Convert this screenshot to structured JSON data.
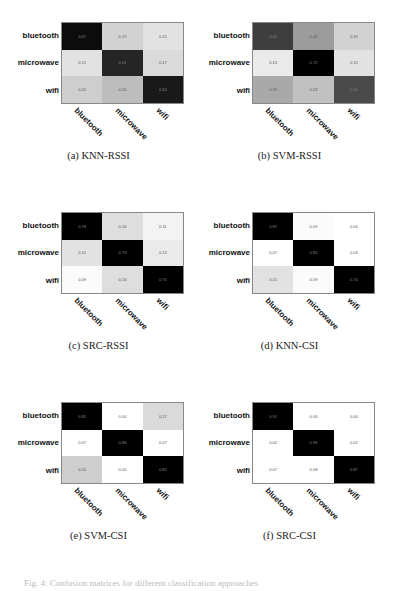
{
  "figure": {
    "caption_partial": "Fig. 4: Confusion matrices for different classification approaches"
  },
  "class_labels": [
    "bluetooth",
    "microwave",
    "wifi"
  ],
  "chart_data": [
    {
      "type": "heatmap",
      "title": "(a) KNN-RSSI",
      "rows": [
        "bluetooth",
        "microwave",
        "wifi"
      ],
      "cols": [
        "bluetooth",
        "microwave",
        "wifi"
      ],
      "values": [
        [
          0.67,
          0.19,
          0.15
        ],
        [
          0.15,
          0.61,
          0.17
        ],
        [
          0.2,
          0.24,
          0.64
        ]
      ]
    },
    {
      "type": "heatmap",
      "title": "(b) SVM-RSSI",
      "rows": [
        "bluetooth",
        "microwave",
        "wifi"
      ],
      "cols": [
        "bluetooth",
        "microwave",
        "wifi"
      ],
      "values": [
        [
          0.55,
          0.32,
          0.19
        ],
        [
          0.13,
          0.72,
          0.15
        ],
        [
          0.29,
          0.23,
          0.52
        ]
      ]
    },
    {
      "type": "heatmap",
      "title": "(c) SRC-RSSI",
      "rows": [
        "bluetooth",
        "microwave",
        "wifi"
      ],
      "cols": [
        "bluetooth",
        "microwave",
        "wifi"
      ],
      "values": [
        [
          0.78,
          0.16,
          0.11
        ],
        [
          0.15,
          0.73,
          0.13
        ],
        [
          0.09,
          0.16,
          0.75
        ]
      ]
    },
    {
      "type": "heatmap",
      "title": "(d) KNN-CSI",
      "rows": [
        "bluetooth",
        "microwave",
        "wifi"
      ],
      "cols": [
        "bluetooth",
        "microwave",
        "wifi"
      ],
      "values": [
        [
          0.87,
          0.09,
          0.04
        ],
        [
          0.07,
          0.85,
          0.04
        ],
        [
          0.15,
          0.09,
          0.74
        ]
      ]
    },
    {
      "type": "heatmap",
      "title": "(e) SVM-CSI",
      "rows": [
        "bluetooth",
        "microwave",
        "wifi"
      ],
      "cols": [
        "bluetooth",
        "microwave",
        "wifi"
      ],
      "values": [
        [
          0.81,
          0.0,
          0.17
        ],
        [
          0.07,
          0.86,
          0.07
        ],
        [
          0.2,
          0.0,
          0.81
        ]
      ]
    },
    {
      "type": "heatmap",
      "title": "(f) SRC-CSI",
      "rows": [
        "bluetooth",
        "microwave",
        "wifi"
      ],
      "cols": [
        "bluetooth",
        "microwave",
        "wifi"
      ],
      "values": [
        [
          0.91,
          0.06,
          0.04
        ],
        [
          0.02,
          0.96,
          0.02
        ],
        [
          0.07,
          0.08,
          0.87
        ]
      ]
    }
  ],
  "panels": [
    {
      "caption": "(a) KNN-RSSI"
    },
    {
      "caption": "(b) SVM-RSSI"
    },
    {
      "caption": "(c) SRC-RSSI"
    },
    {
      "caption": "(d) KNN-CSI"
    },
    {
      "caption": "(e) SVM-CSI"
    },
    {
      "caption": "(f) SRC-CSI"
    }
  ]
}
